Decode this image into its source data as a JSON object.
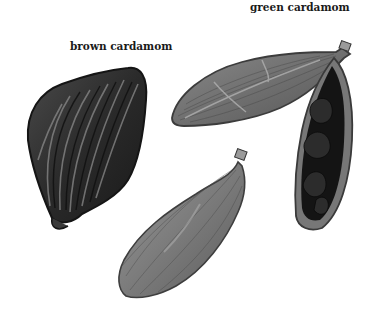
{
  "labels": {
    "green": "green cardamom",
    "brown": "brown cardamom"
  },
  "items": [
    {
      "name": "brown-cardamom-pod",
      "description": "large dark wrinkled pod, left"
    },
    {
      "name": "green-cardamom-pod-closed",
      "description": "closed ribbed pod, top right"
    },
    {
      "name": "green-cardamom-pod-open",
      "description": "opened pod showing dark seeds, right"
    },
    {
      "name": "green-cardamom-pod-whole",
      "description": "whole ribbed pod, bottom center"
    }
  ],
  "colors": {
    "background": "#ffffff",
    "brown_pod": "#2e2e2e",
    "green_pod": "#6e6e6e",
    "seeds": "#151515"
  }
}
